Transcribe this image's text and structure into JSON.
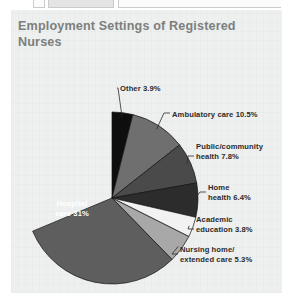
{
  "page": {
    "panel_bg": "#eef0ef",
    "title": "Employment Settings of Registered\nNurses"
  },
  "chart_data": {
    "type": "pie",
    "title": "Employment Settings of Registered Nurses",
    "xlabel": "",
    "ylabel": "",
    "units": "percent",
    "legend_position": "none",
    "labels_with_leaders": true,
    "categories": [
      "Hospital care",
      "Other",
      "Ambulatory care",
      "Public/community health",
      "Home health",
      "Academic education",
      "Nursing home/extended care"
    ],
    "values": [
      31,
      3.9,
      10.5,
      7.8,
      6.4,
      3.8,
      5.3
    ],
    "slices": [
      {
        "name": "other",
        "label": "Other 3.9%",
        "value": 3.9,
        "color": "#0e0e0e",
        "label_x": 120,
        "label_y": 84,
        "label_align": "left"
      },
      {
        "name": "ambulatory-care",
        "label": "Ambulatory care 10.5%",
        "value": 10.5,
        "color": "#6f6f6f",
        "label_x": 172,
        "label_y": 110,
        "label_align": "left"
      },
      {
        "name": "public-community-health",
        "label": "Public/community\nhealth 7.8%",
        "value": 7.8,
        "color": "#4a4a4a",
        "label_x": 196,
        "label_y": 142,
        "label_align": "left"
      },
      {
        "name": "home-health",
        "label": "Home\nhealth 6.4%",
        "value": 6.4,
        "color": "#2c2c2c",
        "label_x": 208,
        "label_y": 183,
        "label_align": "left"
      },
      {
        "name": "academic-education",
        "label": "Academic\neducation 3.8%",
        "value": 3.8,
        "color": "#f2f2f2",
        "label_x": 196,
        "label_y": 215,
        "label_align": "left"
      },
      {
        "name": "nursing-home-extended-care",
        "label": "Nursing home/\nextended care 5.3%",
        "value": 5.3,
        "color": "#a8a8a8",
        "label_x": 180,
        "label_y": 245,
        "label_align": "left"
      },
      {
        "name": "hospital-care",
        "label": "Hospital\ncare 31%",
        "value": 31,
        "color": "#5e5e5e",
        "label_x": 42,
        "label_y": 199,
        "label_align": "center"
      }
    ],
    "geometry": {
      "center_x": 112,
      "center_y": 198,
      "radius": 86,
      "start_angle_deg": -90,
      "direction": "clockwise"
    }
  }
}
